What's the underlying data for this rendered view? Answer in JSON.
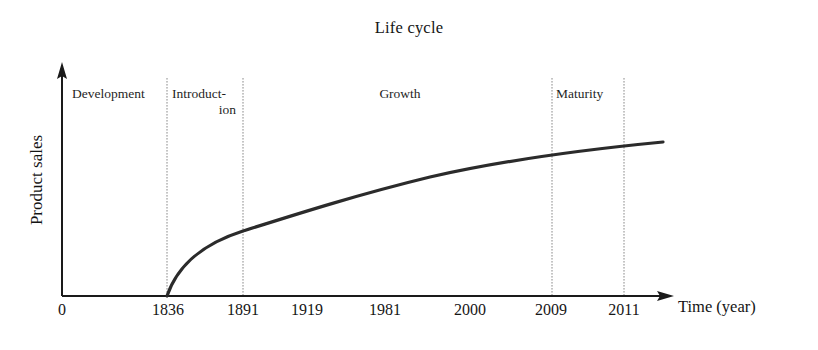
{
  "chart_data": {
    "type": "line",
    "title": "Life cycle",
    "xlabel": "Time (year)",
    "ylabel": "Product sales",
    "grid": false,
    "legend": "none",
    "x_tick_labels": [
      "0",
      "1836",
      "1891",
      "1919",
      "1981",
      "2000",
      "2009",
      "2011"
    ],
    "x_tick_positions_px": [
      62,
      168,
      243,
      307,
      385,
      470,
      551,
      624
    ],
    "y_tick_labels": [],
    "axis_origin_label": "0",
    "phases": [
      {
        "label": "Development",
        "start_label": "0",
        "end_label": "1836"
      },
      {
        "label": "Introduct-\nion",
        "start_label": "1836",
        "end_label": "1891"
      },
      {
        "label": "Growth",
        "start_label": "1891",
        "end_label": "2009"
      },
      {
        "label": "Maturity",
        "start_label": "2009",
        "end_label": "2011"
      }
    ],
    "divider_x_labels": [
      "1836",
      "1891",
      "2009",
      "2011"
    ],
    "series": [
      {
        "name": "Product sales",
        "points_px": [
          [
            167,
            296
          ],
          [
            175,
            277
          ],
          [
            183,
            263
          ],
          [
            192,
            251
          ],
          [
            201,
            242
          ],
          [
            212,
            233
          ],
          [
            224,
            225
          ],
          [
            238,
            217
          ],
          [
            252,
            210
          ],
          [
            268,
            204
          ],
          [
            285,
            198
          ],
          [
            303,
            192
          ],
          [
            322,
            187
          ],
          [
            342,
            182
          ],
          [
            363,
            178
          ],
          [
            385,
            174
          ],
          [
            408,
            170
          ],
          [
            432,
            167
          ],
          [
            457,
            163
          ],
          [
            483,
            160
          ],
          [
            509,
            157
          ],
          [
            536,
            154
          ],
          [
            563,
            151
          ],
          [
            590,
            148
          ],
          [
            617,
            146
          ],
          [
            640,
            144
          ],
          [
            663,
            142
          ]
        ],
        "shape": "concave-increasing-saturating",
        "start_label": "1836",
        "end_note": "curve rises steeply after 1836, flattens toward 2011 and beyond"
      }
    ],
    "colors": {
      "curve": "#2b2b2b",
      "axis": "#1a1a1a",
      "divider": "#7a7a7a",
      "text": "#161616",
      "background": "#ffffff"
    }
  }
}
